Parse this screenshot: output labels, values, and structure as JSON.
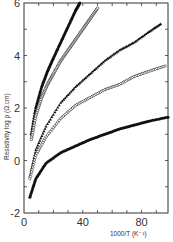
{
  "chart_data": {
    "type": "scatter",
    "title": "",
    "xlabel": "1000/T (K⁻¹)",
    "ylabel": "Resistivity log ρ (Ω.cm)",
    "xlim": [
      0,
      98
    ],
    "ylim": [
      -2,
      6
    ],
    "xticks": [
      0,
      40,
      80
    ],
    "yticks": [
      -2,
      0,
      2,
      4,
      6
    ],
    "grid": false,
    "legend": null,
    "series": [
      {
        "name": "curve-1",
        "marker": "filled-circle",
        "x": [
          5,
          8,
          12,
          16,
          20,
          25,
          30,
          35,
          38
        ],
        "y": [
          1.0,
          2.0,
          2.8,
          3.4,
          3.9,
          4.5,
          5.1,
          5.7,
          6.0
        ]
      },
      {
        "name": "curve-2",
        "marker": "open-circle",
        "x": [
          5,
          8,
          12,
          16,
          20,
          25,
          30,
          35,
          40,
          45,
          50
        ],
        "y": [
          0.8,
          1.7,
          2.4,
          2.9,
          3.3,
          3.8,
          4.2,
          4.6,
          5.0,
          5.4,
          5.8
        ]
      },
      {
        "name": "curve-3",
        "marker": "filled-triangle",
        "x": [
          4,
          8,
          15,
          25,
          35,
          45,
          55,
          65,
          75,
          85,
          93
        ],
        "y": [
          -0.6,
          0.4,
          1.3,
          2.2,
          2.8,
          3.3,
          3.8,
          4.2,
          4.5,
          4.9,
          5.2
        ]
      },
      {
        "name": "curve-4",
        "marker": "open-diamond",
        "x": [
          4,
          8,
          15,
          25,
          35,
          45,
          55,
          65,
          75,
          85,
          96
        ],
        "y": [
          -0.7,
          0.2,
          0.9,
          1.6,
          2.1,
          2.4,
          2.7,
          2.9,
          3.2,
          3.4,
          3.6
        ]
      },
      {
        "name": "curve-5",
        "marker": "filled-circle",
        "x": [
          4,
          8,
          15,
          25,
          35,
          45,
          55,
          65,
          75,
          85,
          98
        ],
        "y": [
          -1.4,
          -0.7,
          -0.1,
          0.3,
          0.55,
          0.8,
          1.0,
          1.2,
          1.35,
          1.5,
          1.65
        ]
      }
    ]
  },
  "axes": {
    "x_tick_labels": [
      "0",
      "40",
      "80"
    ],
    "y_tick_labels": [
      "-2",
      "0",
      "2",
      "4",
      "6"
    ],
    "xlabel": "1000/T (K⁻¹)",
    "ylabel": "Resistivity log ρ (Ω.cm)"
  }
}
